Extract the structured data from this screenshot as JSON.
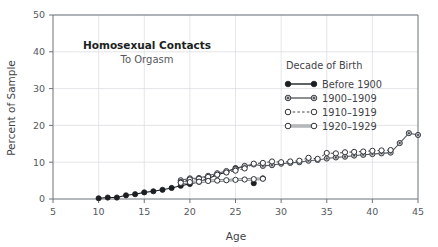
{
  "chart_data": {
    "type": "scatter",
    "title": "Homosexual Contacts",
    "subtitle": "To Orgasm",
    "xlabel": "Age",
    "ylabel": "Percent of Sample",
    "xlim": [
      5,
      45
    ],
    "ylim": [
      0,
      50
    ],
    "xticks": [
      5,
      10,
      15,
      20,
      25,
      30,
      35,
      40,
      45
    ],
    "yticks": [
      0,
      10,
      20,
      30,
      40,
      50
    ],
    "grid": true,
    "legend_title": "Decade of Birth",
    "legend_position": "inside-right",
    "series": [
      {
        "name": "Before 1900",
        "marker": "filled-circle",
        "line": "solid",
        "color": "#1c1f22",
        "x": [
          10,
          11,
          12,
          13,
          14,
          15,
          16,
          17,
          18,
          19,
          20,
          21,
          22,
          23,
          24,
          25,
          26,
          27,
          28
        ],
        "y": [
          0.2,
          0.4,
          0.4,
          1.0,
          1.3,
          1.8,
          2.1,
          2.5,
          3.0,
          3.6,
          4.1,
          4.7,
          5.6,
          6.6,
          7.3,
          8.4,
          8.8,
          4.3,
          5.6
        ]
      },
      {
        "name": "1900–1909",
        "marker": "gray-circle",
        "line": "solid",
        "color": "#5a5f64",
        "x": [
          19,
          20,
          21,
          22,
          23,
          24,
          25,
          26,
          27,
          28,
          29,
          30,
          31,
          32,
          33,
          34,
          35,
          36,
          37,
          38,
          39,
          40,
          41,
          42,
          43,
          44,
          45
        ],
        "y": [
          5.1,
          5.6,
          5.7,
          6.3,
          7.0,
          7.6,
          8.1,
          9.0,
          9.4,
          9.0,
          9.2,
          9.6,
          9.8,
          10.0,
          10.4,
          10.6,
          11.0,
          11.3,
          11.5,
          11.8,
          12.0,
          12.2,
          12.4,
          12.6,
          15.2,
          17.9,
          17.4
        ]
      },
      {
        "name": "1910–1919",
        "marker": "open-circle",
        "line": "dotted",
        "color": "#3f4348",
        "x": [
          19,
          20,
          21,
          22,
          23,
          24,
          25,
          26,
          27,
          28,
          29,
          30,
          31,
          32,
          33,
          34,
          35,
          36,
          37,
          38,
          39,
          40,
          41,
          42
        ],
        "y": [
          4.6,
          5.3,
          5.5,
          6.0,
          6.6,
          7.2,
          7.7,
          8.3,
          9.6,
          9.8,
          10.2,
          10.0,
          10.2,
          10.4,
          11.2,
          10.9,
          12.5,
          12.4,
          12.7,
          12.8,
          12.9,
          13.1,
          13.2,
          13.3
        ]
      },
      {
        "name": "1920–1929",
        "marker": "open-circle",
        "line": "double",
        "color": "#6d7378",
        "x": [
          19,
          20,
          21,
          22,
          23,
          24,
          25,
          26,
          27,
          28
        ],
        "y": [
          4.4,
          4.6,
          4.7,
          4.9,
          5.0,
          5.1,
          5.2,
          5.3,
          5.4,
          5.5
        ]
      }
    ]
  }
}
